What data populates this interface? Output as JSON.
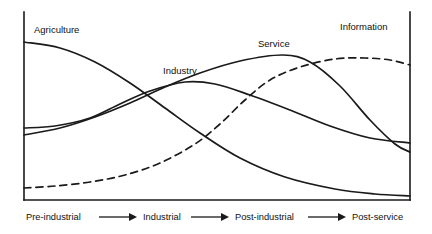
{
  "figure": {
    "background_color": "#ffffff",
    "line_color": "#1a1a1a"
  },
  "chart_data": {
    "type": "line",
    "title": "",
    "xlabel": "",
    "ylabel": "",
    "grid": false,
    "legend_position": "inline-curve-labels",
    "axes": {
      "left_axis": true,
      "right_axis": true,
      "bottom_axis": true,
      "top_axis": false,
      "x_range": [
        0,
        1
      ],
      "y_range": [
        0,
        1
      ],
      "tick_labels": []
    },
    "x_stage_labels": [
      "Pre-industrial",
      "Industrial",
      "Post-industrial",
      "Post-service"
    ],
    "series": [
      {
        "name": "Agriculture",
        "style": "solid",
        "label": "Agriculture",
        "label_x": 34,
        "label_y": 33,
        "points": [
          [
            24,
            42
          ],
          [
            60,
            48
          ],
          [
            95,
            62
          ],
          [
            130,
            83
          ],
          [
            165,
            108
          ],
          [
            200,
            133
          ],
          [
            240,
            158
          ],
          [
            285,
            177
          ],
          [
            335,
            189
          ],
          [
            375,
            194
          ],
          [
            410,
            196
          ]
        ]
      },
      {
        "name": "Industry",
        "style": "solid",
        "label": "Industry",
        "label_x": 163,
        "label_y": 74,
        "points": [
          [
            24,
            128
          ],
          [
            55,
            126
          ],
          [
            90,
            118
          ],
          [
            120,
            104
          ],
          [
            150,
            91
          ],
          [
            185,
            82
          ],
          [
            215,
            84
          ],
          [
            250,
            95
          ],
          [
            290,
            110
          ],
          [
            330,
            126
          ],
          [
            370,
            138
          ],
          [
            410,
            143
          ]
        ]
      },
      {
        "name": "Service",
        "style": "solid",
        "label": "Service",
        "label_x": 258,
        "label_y": 47,
        "points": [
          [
            24,
            135
          ],
          [
            60,
            128
          ],
          [
            95,
            117
          ],
          [
            130,
            103
          ],
          [
            165,
            87
          ],
          [
            200,
            73
          ],
          [
            240,
            61
          ],
          [
            283,
            55
          ],
          [
            310,
            62
          ],
          [
            340,
            86
          ],
          [
            370,
            120
          ],
          [
            395,
            144
          ],
          [
            410,
            152
          ]
        ]
      },
      {
        "name": "Information",
        "style": "dashed",
        "label": "Information",
        "label_x": 340,
        "label_y": 30,
        "points": [
          [
            24,
            188
          ],
          [
            55,
            186
          ],
          [
            90,
            182
          ],
          [
            125,
            175
          ],
          [
            160,
            163
          ],
          [
            195,
            144
          ],
          [
            220,
            124
          ],
          [
            245,
            100
          ],
          [
            270,
            80
          ],
          [
            300,
            67
          ],
          [
            335,
            59
          ],
          [
            365,
            58
          ],
          [
            390,
            60
          ],
          [
            410,
            65
          ]
        ]
      }
    ]
  },
  "axis_stages": [
    {
      "label": "Pre-industrial",
      "text_x": 26,
      "text_y": 220,
      "arrow_x1": 99,
      "arrow_x2": 137,
      "arrow_y": 217
    },
    {
      "label": "Industrial",
      "text_x": 143,
      "text_y": 220,
      "arrow_x1": 191,
      "arrow_x2": 229,
      "arrow_y": 217
    },
    {
      "label": "Post-industrial",
      "text_x": 235,
      "text_y": 220,
      "arrow_x1": 308,
      "arrow_x2": 346,
      "arrow_y": 217
    },
    {
      "label": "Post-service",
      "text_x": 352,
      "text_y": 220,
      "arrow_x1": null,
      "arrow_x2": null,
      "arrow_y": null
    }
  ]
}
